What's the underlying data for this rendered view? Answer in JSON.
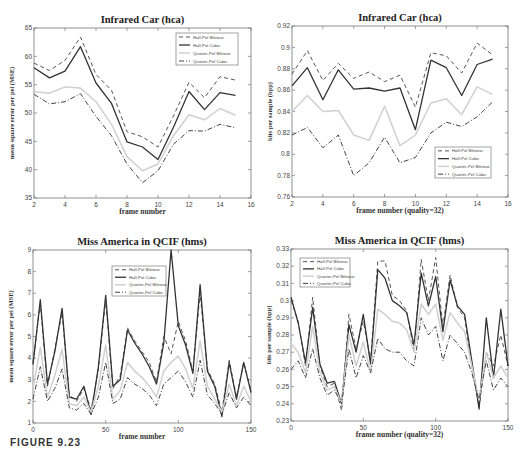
{
  "figure": {
    "caption": "FIGURE 9.23"
  },
  "legend_labels": [
    "Half-Pel Bilinear",
    "Half-Pel Cubic",
    "Quarter-Pel Bilinear",
    "Quarter-Pel Cubic"
  ],
  "series_styles": [
    {
      "name": "Half-Pel Bilinear",
      "dash": "4,3",
      "color": "#555555",
      "width": 1
    },
    {
      "name": "Half-Pel Cubic",
      "dash": "",
      "color": "#333333",
      "width": 1.3
    },
    {
      "name": "Quarter-Pel Bilinear",
      "dash": "",
      "color": "#d0d0d0",
      "width": 1.5
    },
    {
      "name": "Quarter-Pel Cubic",
      "dash": "5,2,1,2",
      "color": "#444444",
      "width": 1
    }
  ],
  "chart_data": [
    {
      "id": "tl",
      "type": "line",
      "title": "Infrared Car (hca)",
      "xlabel": "frame number",
      "ylabel": "mean square error per pel (MSE)",
      "xlim": [
        2,
        16
      ],
      "ylim": [
        35,
        65
      ],
      "xticks": [
        2,
        4,
        6,
        8,
        10,
        12,
        14,
        16
      ],
      "yticks": [
        35,
        40,
        45,
        50,
        55,
        60,
        65
      ],
      "grid": false,
      "legend_position": "upper right",
      "box": {
        "x": 34,
        "y": 28,
        "w": 217,
        "h": 170
      },
      "legend": {
        "x": 176,
        "y": 33,
        "w": 62,
        "h": 32
      },
      "x": [
        2,
        3,
        4,
        5,
        6,
        7,
        8,
        9,
        10,
        11,
        12,
        13,
        14,
        15
      ],
      "series": [
        {
          "name": "Half-Pel Bilinear",
          "values": [
            58.8,
            57.5,
            59.3,
            63.4,
            56.8,
            54.0,
            46.7,
            45.8,
            44.0,
            49.5,
            55.4,
            52.7,
            56.4,
            55.8
          ]
        },
        {
          "name": "Half-Pel Cubic",
          "values": [
            58.0,
            56.2,
            57.4,
            61.7,
            55.3,
            51.7,
            44.9,
            44.0,
            41.8,
            47.5,
            53.8,
            50.6,
            53.6,
            53.1
          ]
        },
        {
          "name": "Quarter-Pel Bilinear",
          "values": [
            53.8,
            53.5,
            54.6,
            54.4,
            52.0,
            48.0,
            42.3,
            39.8,
            41.0,
            46.0,
            49.7,
            48.8,
            50.8,
            49.6
          ]
        },
        {
          "name": "Quarter-Pel Cubic",
          "values": [
            53.3,
            51.6,
            52.0,
            53.4,
            49.4,
            46.0,
            41.0,
            37.7,
            39.8,
            44.5,
            46.9,
            46.8,
            48.0,
            47.4
          ]
        }
      ]
    },
    {
      "id": "tr",
      "type": "line",
      "title": "Infrared Car (hca)",
      "xlabel": "frame number (quality=32)",
      "ylabel": "bits per sample (bpp)",
      "xlim": [
        2,
        16
      ],
      "ylim": [
        0.76,
        0.92
      ],
      "xticks": [
        2,
        4,
        6,
        8,
        10,
        12,
        14,
        16
      ],
      "yticks": [
        0.76,
        0.78,
        0.8,
        0.82,
        0.84,
        0.86,
        0.88,
        0.9,
        0.92
      ],
      "grid": false,
      "legend_position": "lower right",
      "box": {
        "x": 292,
        "y": 26,
        "w": 216,
        "h": 171
      },
      "legend": {
        "x": 435,
        "y": 147,
        "w": 56,
        "h": 31
      },
      "x": [
        2,
        3,
        4,
        5,
        6,
        7,
        8,
        9,
        10,
        11,
        12,
        13,
        14,
        15
      ],
      "series": [
        {
          "name": "Half-Pel Bilinear",
          "values": [
            0.875,
            0.897,
            0.869,
            0.885,
            0.871,
            0.877,
            0.868,
            0.874,
            0.844,
            0.895,
            0.892,
            0.876,
            0.904,
            0.893
          ]
        },
        {
          "name": "Half-Pel Cubic",
          "values": [
            0.864,
            0.881,
            0.851,
            0.879,
            0.861,
            0.862,
            0.859,
            0.862,
            0.823,
            0.888,
            0.881,
            0.855,
            0.884,
            0.889
          ]
        },
        {
          "name": "Quarter-Pel Bilinear",
          "values": [
            0.84,
            0.855,
            0.84,
            0.841,
            0.818,
            0.813,
            0.845,
            0.808,
            0.818,
            0.848,
            0.852,
            0.837,
            0.863,
            0.856
          ]
        },
        {
          "name": "Quarter-Pel Cubic",
          "values": [
            0.818,
            0.825,
            0.806,
            0.818,
            0.78,
            0.792,
            0.816,
            0.792,
            0.797,
            0.82,
            0.83,
            0.826,
            0.835,
            0.849
          ]
        }
      ]
    },
    {
      "id": "bl",
      "type": "line",
      "title": "Miss America in QCIF (hms)",
      "xlabel": "frame number",
      "ylabel": "mean square error per pel (MSE)",
      "xlim": [
        0,
        150
      ],
      "ylim": [
        1,
        9
      ],
      "xticks": [
        0,
        50,
        100,
        150
      ],
      "yticks": [
        1,
        2,
        3,
        4,
        5,
        6,
        7,
        8,
        9
      ],
      "grid": false,
      "legend_position": "upper center",
      "box": {
        "x": 33,
        "y": 250,
        "w": 218,
        "h": 173
      },
      "legend": {
        "x": 112,
        "y": 266,
        "w": 54,
        "h": 30
      },
      "x_step": 5,
      "x": [
        0,
        5,
        10,
        15,
        20,
        25,
        30,
        35,
        40,
        45,
        50,
        55,
        60,
        65,
        70,
        75,
        80,
        85,
        90,
        95,
        100,
        105,
        110,
        115,
        120,
        125,
        130,
        135,
        140,
        145,
        150
      ],
      "series": [
        {
          "name": "Half-Pel Bilinear",
          "values": [
            3.8,
            6.5,
            2.7,
            4.4,
            6.1,
            2.3,
            2.0,
            2.6,
            1.6,
            3.5,
            6.7,
            2.6,
            3.2,
            5.4,
            4.8,
            4.3,
            3.8,
            2.9,
            5.0,
            4.2,
            5.7,
            4.8,
            3.4,
            7.0,
            3.5,
            2.8,
            1.5,
            3.9,
            2.2,
            3.8,
            2.5
          ]
        },
        {
          "name": "Half-Pel Cubic",
          "values": [
            3.7,
            6.7,
            2.8,
            4.3,
            6.3,
            2.2,
            2.1,
            2.7,
            1.4,
            3.6,
            6.9,
            2.7,
            3.0,
            5.3,
            4.7,
            4.2,
            3.6,
            2.8,
            4.7,
            9.0,
            5.5,
            4.6,
            3.3,
            7.4,
            3.4,
            2.7,
            1.3,
            3.8,
            2.1,
            3.8,
            2.4
          ]
        },
        {
          "name": "Quarter-Pel Bilinear",
          "values": [
            2.6,
            4.5,
            2.2,
            3.2,
            4.4,
            1.9,
            1.8,
            2.2,
            1.5,
            2.7,
            4.6,
            2.1,
            2.5,
            3.8,
            3.4,
            3.1,
            2.7,
            2.2,
            3.4,
            3.8,
            4.1,
            3.5,
            2.6,
            4.8,
            2.7,
            2.1,
            1.5,
            2.8,
            1.8,
            2.7,
            2.0
          ]
        },
        {
          "name": "Quarter-Pel Cubic",
          "values": [
            2.1,
            3.6,
            2.0,
            2.6,
            3.5,
            1.7,
            1.6,
            1.9,
            1.4,
            2.2,
            3.8,
            1.9,
            2.1,
            3.1,
            2.8,
            2.6,
            2.3,
            1.8,
            2.8,
            3.1,
            3.4,
            2.9,
            2.2,
            3.9,
            2.3,
            1.9,
            1.4,
            2.4,
            1.7,
            2.2,
            1.8
          ]
        }
      ]
    },
    {
      "id": "br",
      "type": "line",
      "title": "Miss America in QCIF (hms)",
      "xlabel": "frame number (quality=32)",
      "ylabel": "bits per sample (bpp)",
      "xlim": [
        0,
        150
      ],
      "ylim": [
        0.23,
        0.33
      ],
      "xticks": [
        0,
        50,
        100,
        150
      ],
      "yticks": [
        0.23,
        0.24,
        0.25,
        0.26,
        0.27,
        0.28,
        0.29,
        0.3,
        0.31,
        0.32,
        0.33
      ],
      "grid": false,
      "legend_position": "upper left",
      "box": {
        "x": 291,
        "y": 249,
        "w": 217,
        "h": 172
      },
      "legend": {
        "x": 300,
        "y": 258,
        "w": 50,
        "h": 29
      },
      "x": [
        0,
        5,
        10,
        15,
        20,
        25,
        30,
        35,
        40,
        45,
        50,
        55,
        60,
        65,
        70,
        75,
        80,
        85,
        90,
        95,
        100,
        105,
        110,
        115,
        120,
        125,
        130,
        135,
        140,
        145,
        150
      ],
      "series": [
        {
          "name": "Half-Pel Bilinear",
          "values": [
            0.3,
            0.288,
            0.262,
            0.302,
            0.262,
            0.25,
            0.252,
            0.236,
            0.292,
            0.272,
            0.288,
            0.265,
            0.323,
            0.323,
            0.303,
            0.3,
            0.294,
            0.27,
            0.324,
            0.3,
            0.325,
            0.285,
            0.315,
            0.296,
            0.29,
            0.262,
            0.238,
            0.27,
            0.262,
            0.28,
            0.262
          ]
        },
        {
          "name": "Half-Pel Cubic",
          "values": [
            0.302,
            0.287,
            0.264,
            0.296,
            0.263,
            0.252,
            0.253,
            0.24,
            0.286,
            0.27,
            0.292,
            0.263,
            0.318,
            0.313,
            0.3,
            0.297,
            0.293,
            0.274,
            0.316,
            0.297,
            0.314,
            0.282,
            0.312,
            0.297,
            0.292,
            0.265,
            0.237,
            0.29,
            0.255,
            0.295,
            0.262
          ]
        },
        {
          "name": "Quarter-Pel Bilinear",
          "values": [
            0.275,
            0.27,
            0.258,
            0.285,
            0.258,
            0.248,
            0.25,
            0.24,
            0.28,
            0.262,
            0.276,
            0.258,
            0.295,
            0.292,
            0.288,
            0.287,
            0.283,
            0.27,
            0.298,
            0.292,
            0.298,
            0.277,
            0.293,
            0.287,
            0.282,
            0.262,
            0.242,
            0.27,
            0.255,
            0.262,
            0.255
          ]
        },
        {
          "name": "Quarter-Pel Cubic",
          "values": [
            0.26,
            0.265,
            0.255,
            0.272,
            0.255,
            0.245,
            0.248,
            0.24,
            0.272,
            0.255,
            0.268,
            0.258,
            0.278,
            0.272,
            0.27,
            0.27,
            0.265,
            0.262,
            0.29,
            0.28,
            0.285,
            0.265,
            0.28,
            0.275,
            0.27,
            0.258,
            0.242,
            0.265,
            0.248,
            0.255,
            0.25
          ]
        }
      ]
    }
  ]
}
